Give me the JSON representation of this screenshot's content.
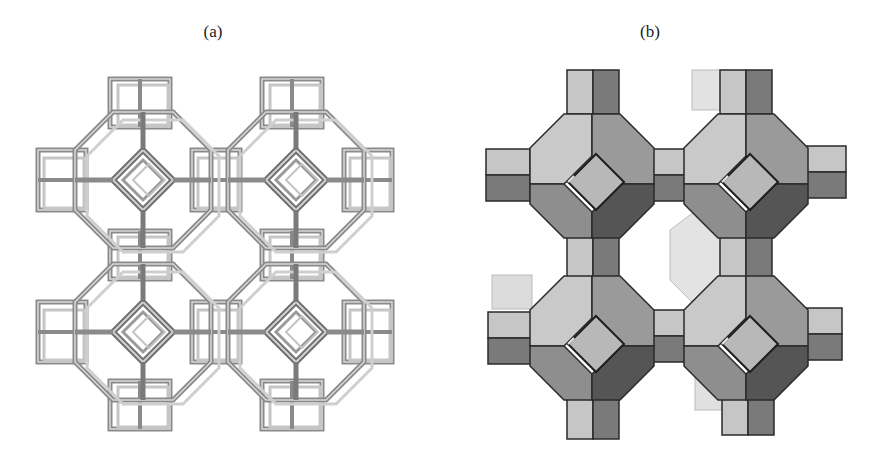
{
  "figure": {
    "panels": [
      {
        "label": "(a)",
        "style": "wireframe",
        "description": "Stick/wireframe model of a zeolite framework (LTA-type): four truncated-octahedron (sodalite) cages in a 2x2 arrangement linked by cubic double-4-ring units",
        "colors": {
          "stroke": "#8a8a8a",
          "stroke_light": "#c8c8c8",
          "stroke_dark": "#5a5a5a"
        }
      },
      {
        "label": "(b)",
        "style": "polyhedral",
        "description": "Solid polyhedral model of the same framework: four truncated octahedra linked by cubes around a central open cage",
        "colors": {
          "face_light": "#c9c9c9",
          "face_mid": "#9a9a9a",
          "face_dark": "#6e6e6e",
          "face_darkest": "#4a4a4a",
          "edge": "#2a2a2a",
          "back_face": "#e0e0e0"
        }
      }
    ]
  }
}
